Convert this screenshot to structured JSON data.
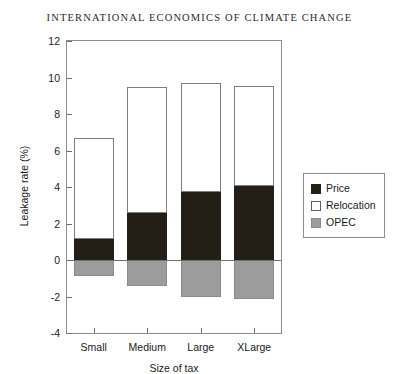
{
  "running_head": "INTERNATIONAL ECONOMICS OF CLIMATE CHANGE",
  "legend": {
    "items": [
      {
        "label": "Price",
        "color": "#231f17"
      },
      {
        "label": "Relocation",
        "color": "#ffffff"
      },
      {
        "label": "OPEC",
        "color": "#9c9c9c"
      }
    ]
  },
  "chart_data": {
    "type": "bar",
    "stacked": true,
    "title": "",
    "xlabel": "Size of tax",
    "ylabel": "Leakage rate (%)",
    "categories": [
      "Small",
      "Medium",
      "Large",
      "XLarge"
    ],
    "ylim": [
      -4,
      12
    ],
    "yticks": [
      -4,
      -2,
      0,
      2,
      4,
      6,
      8,
      10,
      12
    ],
    "ytick_labels": [
      "-4",
      "-2",
      "0",
      "2",
      "4",
      "6",
      "8",
      "10",
      "12"
    ],
    "grid": false,
    "legend_position": "right",
    "series": [
      {
        "name": "Price",
        "color": "#231f17",
        "values": [
          1.15,
          2.6,
          3.7,
          4.05
        ]
      },
      {
        "name": "Relocation",
        "color": "#ffffff",
        "values": [
          5.55,
          6.9,
          6.0,
          5.5
        ]
      },
      {
        "name": "OPEC",
        "color": "#9c9c9c",
        "values": [
          -0.85,
          -1.4,
          -2.0,
          -2.15
        ]
      }
    ],
    "totals_positive": [
      6.7,
      9.5,
      9.7,
      9.55
    ],
    "annotations": []
  }
}
